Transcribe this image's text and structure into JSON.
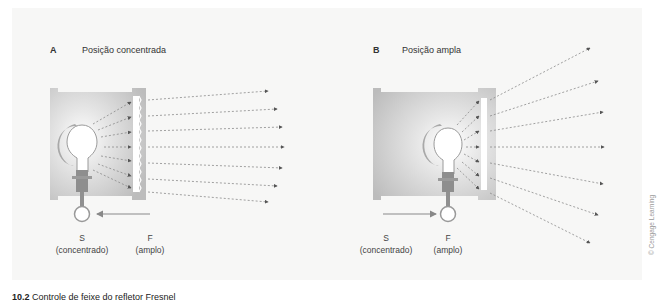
{
  "figure": {
    "panels": [
      {
        "letter": "A",
        "title": "Posição concentrada",
        "labels": {
          "s": "S",
          "s_sub": "(concentrado)",
          "f": "F",
          "f_sub": "(amplo)"
        },
        "arrow_direction": "left",
        "lamp_position": "S"
      },
      {
        "letter": "B",
        "title": "Posição ampla",
        "labels": {
          "s": "S",
          "s_sub": "(concentrado)",
          "f": "F",
          "f_sub": "(amplo)"
        },
        "arrow_direction": "right",
        "lamp_position": "F"
      }
    ],
    "caption": {
      "number": "10.2",
      "text": "Controle de feixe do refletor Fresnel"
    },
    "credit": "© Cengage Learning"
  },
  "colors": {
    "housing": "#bdbdbd",
    "housing_dark": "#a6a6a6",
    "lens": "#ffffff",
    "socket": "#8c8c8c",
    "arrow": "#888888",
    "ray": "#8a8a8a",
    "background": "#f7f7f6"
  }
}
